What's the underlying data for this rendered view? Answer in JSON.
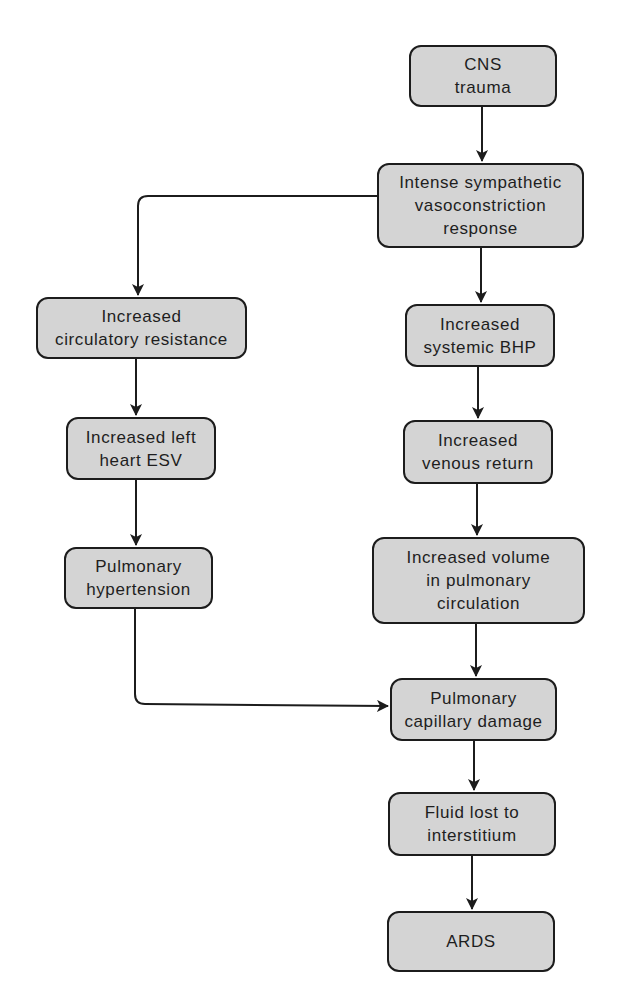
{
  "diagram": {
    "type": "flowchart",
    "colors": {
      "node_fill": "#d4d4d4",
      "node_border": "#1c1c1c",
      "text": "#1e1e1e",
      "edge": "#1c1c1c",
      "background": "#ffffff"
    },
    "nodes": {
      "cns_trauma": {
        "label": "CNS\ntrauma"
      },
      "sympathetic": {
        "label": "Intense sympathetic\nvasoconstriction\nresponse"
      },
      "circ_resistance": {
        "label": "Increased\ncirculatory resistance"
      },
      "left_heart_esv": {
        "label": "Increased left\nheart ESV"
      },
      "pulm_hypertension": {
        "label": "Pulmonary\nhypertension"
      },
      "systemic_bhp": {
        "label": "Increased\nsystemic BHP"
      },
      "venous_return": {
        "label": "Increased\nvenous return"
      },
      "pulm_volume": {
        "label": "Increased volume\nin pulmonary\ncirculation"
      },
      "capillary_damage": {
        "label": "Pulmonary\ncapillary damage"
      },
      "fluid_lost": {
        "label": "Fluid lost to\ninterstitium"
      },
      "ards": {
        "label": "ARDS"
      }
    },
    "edges": [
      {
        "from": "cns_trauma",
        "to": "sympathetic"
      },
      {
        "from": "sympathetic",
        "to": "circ_resistance"
      },
      {
        "from": "sympathetic",
        "to": "systemic_bhp"
      },
      {
        "from": "circ_resistance",
        "to": "left_heart_esv"
      },
      {
        "from": "left_heart_esv",
        "to": "pulm_hypertension"
      },
      {
        "from": "pulm_hypertension",
        "to": "capillary_damage"
      },
      {
        "from": "systemic_bhp",
        "to": "venous_return"
      },
      {
        "from": "venous_return",
        "to": "pulm_volume"
      },
      {
        "from": "pulm_volume",
        "to": "capillary_damage"
      },
      {
        "from": "capillary_damage",
        "to": "fluid_lost"
      },
      {
        "from": "fluid_lost",
        "to": "ards"
      }
    ]
  }
}
